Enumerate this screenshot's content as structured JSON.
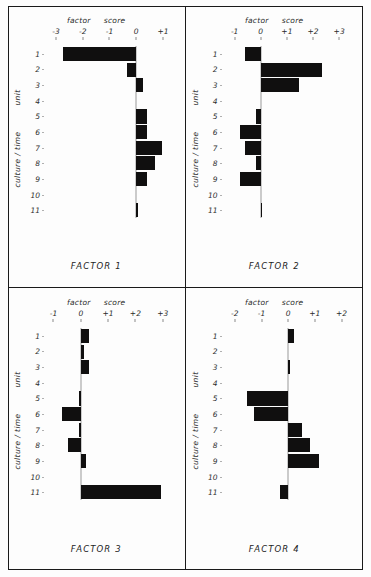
{
  "figure": {
    "axis_words": {
      "factor": "factor",
      "score": "score"
    },
    "row_axis_labels": {
      "unit": "unit",
      "culture_time": "culture / time"
    },
    "row_categories": [
      "1",
      "2",
      "3",
      "4",
      "5",
      "6",
      "7",
      "8",
      "9",
      "10",
      "11"
    ],
    "bar_color": "#100f0f",
    "frame_color": "#1a1a1a"
  },
  "chart_data": [
    {
      "type": "bar",
      "orientation": "horizontal",
      "title": "FACTOR 1",
      "xlabel": "factor score",
      "ylabel": "culture / time unit",
      "categories": [
        "1",
        "2",
        "3",
        "4",
        "5",
        "6",
        "7",
        "8",
        "9",
        "10",
        "11"
      ],
      "values": [
        -2.75,
        -0.35,
        0.25,
        0.0,
        0.42,
        0.42,
        0.95,
        0.72,
        0.42,
        0.0,
        0.05
      ],
      "xlim": [
        -3.3,
        1.45
      ],
      "xticks": [
        -3,
        -2,
        -1,
        0,
        1
      ],
      "xticklabels": [
        "-3",
        "-2",
        "-1",
        "0",
        "+1"
      ],
      "grid": false,
      "legend": false
    },
    {
      "type": "bar",
      "orientation": "horizontal",
      "title": "FACTOR 2",
      "xlabel": "factor score",
      "ylabel": "culture / time unit",
      "categories": [
        "1",
        "2",
        "3",
        "4",
        "5",
        "6",
        "7",
        "8",
        "9",
        "10",
        "11"
      ],
      "values": [
        -0.62,
        2.35,
        1.45,
        0.0,
        -0.18,
        -0.78,
        -0.62,
        -0.18,
        -0.78,
        0.0,
        0.05
      ],
      "xlim": [
        -1.35,
        3.55
      ],
      "xticks": [
        -1,
        0,
        1,
        2,
        3
      ],
      "xticklabels": [
        "-1",
        "0",
        "+1",
        "+2",
        "+3"
      ],
      "grid": false,
      "legend": false
    },
    {
      "type": "bar",
      "orientation": "horizontal",
      "title": "FACTOR 3",
      "xlabel": "factor score",
      "ylabel": "culture / time unit",
      "categories": [
        "1",
        "2",
        "3",
        "4",
        "5",
        "6",
        "7",
        "8",
        "9",
        "10",
        "11"
      ],
      "values": [
        0.3,
        0.12,
        0.3,
        0.0,
        -0.06,
        -0.68,
        -0.06,
        -0.45,
        0.18,
        0.0,
        2.95
      ],
      "xlim": [
        -1.2,
        3.45
      ],
      "xticks": [
        -1,
        0,
        1,
        2,
        3
      ],
      "xticklabels": [
        "-1",
        "0",
        "+1",
        "+2",
        "+3"
      ],
      "grid": false,
      "legend": false
    },
    {
      "type": "bar",
      "orientation": "horizontal",
      "title": "FACTOR 4",
      "xlabel": "factor score",
      "ylabel": "culture / time unit",
      "categories": [
        "1",
        "2",
        "3",
        "4",
        "5",
        "6",
        "7",
        "8",
        "9",
        "10",
        "11"
      ],
      "values": [
        0.22,
        0.0,
        0.04,
        0.0,
        -1.55,
        -1.3,
        0.52,
        0.82,
        1.15,
        0.0,
        -0.3
      ],
      "xlim": [
        -2.35,
        2.45
      ],
      "xticks": [
        -2,
        -1,
        0,
        1,
        2
      ],
      "xticklabels": [
        "-2",
        "-1",
        "0",
        "+1",
        "+2"
      ],
      "grid": false,
      "legend": false
    }
  ]
}
